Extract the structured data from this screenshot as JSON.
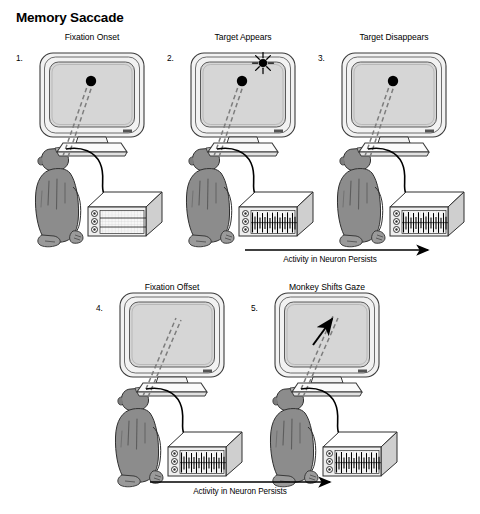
{
  "figure": {
    "title": "Memory Saccade",
    "type": "scientific-diagram",
    "colors": {
      "background": "#ffffff",
      "ink": "#000000",
      "screen_fill": "#d6d6d6",
      "bezel_fill": "#f2f2f2",
      "monkey_fill": "#8c8c8c",
      "monkey_shadow": "#6e6e6e",
      "device_front": "#efefef",
      "device_top": "#ffffff",
      "device_side": "#cfcfcf",
      "trace_fill": "#f7f7f7"
    },
    "rows": [
      {
        "row_label": "Activity in Neuron Persists",
        "panels": [
          {
            "number": "1.",
            "caption": "Fixation Onset",
            "screen": {
              "fixation_dot": true,
              "target_starburst": false,
              "gaze_line": true,
              "gaze_arrowhead": false
            },
            "recorder": {
              "spiking": false
            }
          },
          {
            "number": "2.",
            "caption": "Target Appears",
            "screen": {
              "fixation_dot": true,
              "target_starburst": true,
              "gaze_line": true,
              "gaze_arrowhead": false
            },
            "recorder": {
              "spiking": true
            }
          },
          {
            "number": "3.",
            "caption": "Target Disappears",
            "screen": {
              "fixation_dot": true,
              "target_starburst": false,
              "gaze_line": true,
              "gaze_arrowhead": false
            },
            "recorder": {
              "spiking": true
            }
          }
        ]
      },
      {
        "row_label": "Activity in Neuron Persists",
        "panels": [
          {
            "number": "4.",
            "caption": "Fixation Offset",
            "screen": {
              "fixation_dot": false,
              "target_starburst": false,
              "gaze_line": true,
              "gaze_arrowhead": false
            },
            "recorder": {
              "spiking": true
            }
          },
          {
            "number": "5.",
            "caption": "Monkey Shifts Gaze",
            "screen": {
              "fixation_dot": false,
              "target_starburst": false,
              "gaze_line": true,
              "gaze_arrowhead": true
            },
            "recorder": {
              "spiking": true
            }
          }
        ]
      }
    ]
  }
}
